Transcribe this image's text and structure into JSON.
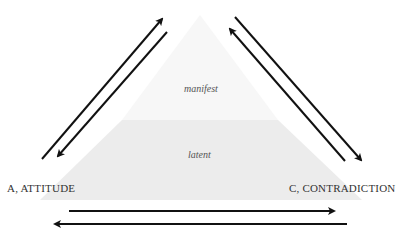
{
  "diagram": {
    "layers": {
      "upper": "manifest",
      "lower": "latent"
    },
    "corners": {
      "left": "A, ATTITUDE",
      "right": "C, CONTRADICTION"
    },
    "colors": {
      "manifest_fill": "#f7f7f7",
      "latent_fill": "#ececec",
      "arrow": "#111111",
      "text": "#333333"
    }
  }
}
